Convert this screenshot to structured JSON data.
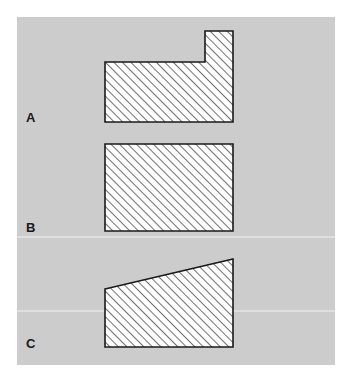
{
  "figure": {
    "canvas": {
      "width": 351,
      "height": 372,
      "background": "#ffffff"
    },
    "panel": {
      "x": 17,
      "y": 17,
      "width": 318,
      "height": 348,
      "fill": "#cccccc"
    },
    "colors": {
      "background": "#ffffff",
      "panel_fill": "#cccccc",
      "shape_fill": "#ffffff",
      "shape_outline": "#1a1a1a",
      "hatch_line": "#333333",
      "label_text": "#1a1a1a"
    },
    "hatch": {
      "angle_degrees": 45,
      "direction": "up-to-the-right",
      "spacing_px": 6,
      "line_width_px": 1.4
    },
    "labels": [
      {
        "id": "a",
        "text": "A",
        "x": 26,
        "y": 111
      },
      {
        "id": "b",
        "text": "B",
        "x": 26,
        "y": 221
      },
      {
        "id": "c",
        "text": "C",
        "x": 26,
        "y": 337
      }
    ],
    "shapes": [
      {
        "id": "shape-a",
        "label": "A",
        "description": "Stepped L-shaped profile: low rectangular body on the left with a taller riser block at the right end",
        "points": "105,62 205,62 205,31 233,31 233,122 105,122",
        "bounds": {
          "left": 105,
          "top": 31,
          "right": 233,
          "bottom": 122
        },
        "body_top_y": 62,
        "riser_top_y": 31,
        "riser_left_x": 205
      },
      {
        "id": "shape-b",
        "label": "B",
        "description": "Plain rectangular profile of uniform height",
        "points": "105,144 233,144 233,231 105,231",
        "bounds": {
          "left": 105,
          "top": 144,
          "right": 233,
          "bottom": 231
        }
      },
      {
        "id": "shape-c",
        "label": "C",
        "description": "Trapezoidal profile with a top edge sloping upward from left to right",
        "points": "105,289 233,259 233,347 105,347",
        "bounds": {
          "left": 105,
          "top": 259,
          "right": 233,
          "bottom": 347
        },
        "top_left_y": 289,
        "top_right_y": 259
      }
    ]
  }
}
